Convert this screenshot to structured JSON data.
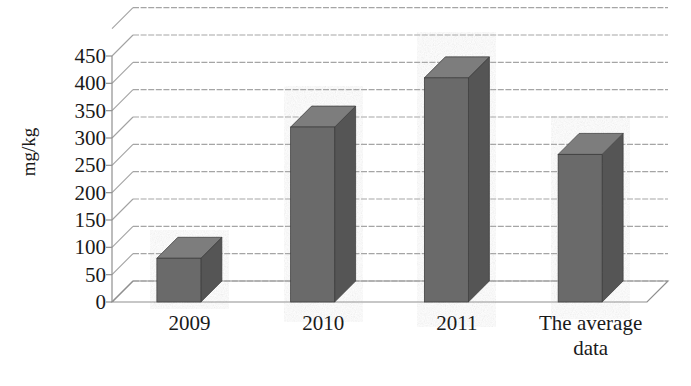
{
  "chart_data": {
    "type": "bar",
    "title": "",
    "subtitle": "",
    "xlabel": "",
    "ylabel": "mg/kg",
    "categories": [
      "2009",
      "2010",
      "2011",
      "The average data"
    ],
    "values": [
      80,
      320,
      410,
      270
    ],
    "series": [
      {
        "name": "mg/kg",
        "values": [
          80,
          320,
          410,
          270
        ]
      }
    ],
    "ylim": [
      0,
      500
    ],
    "y_ticks": [
      0,
      50,
      100,
      150,
      200,
      250,
      300,
      350,
      400,
      450
    ],
    "y_tick_labels": [
      "0",
      "50",
      "100",
      "150",
      "200",
      "250",
      "300",
      "350",
      "400",
      "450"
    ],
    "grid": true,
    "grid_axis": "y",
    "legend": false,
    "legend_position": "none",
    "style": "3d-column",
    "bar_color": "#6b6b6b",
    "bar_side_color": "#545454",
    "bar_top_color": "#7d7d7d",
    "grid_color": "#8f8f8f",
    "axis_color": "#8f8f8f",
    "text_color": "#1a1a1a",
    "background": "#ffffff",
    "annotations": []
  },
  "axis": {
    "y_title": "mg/kg",
    "tick_labels": [
      "450",
      "400",
      "350",
      "300",
      "250",
      "200",
      "150",
      "100",
      "50",
      "0"
    ]
  },
  "categories": [
    {
      "line1": "2009",
      "line2": ""
    },
    {
      "line1": "2010",
      "line2": ""
    },
    {
      "line1": "2011",
      "line2": ""
    },
    {
      "line1": "The average",
      "line2": "data"
    }
  ]
}
